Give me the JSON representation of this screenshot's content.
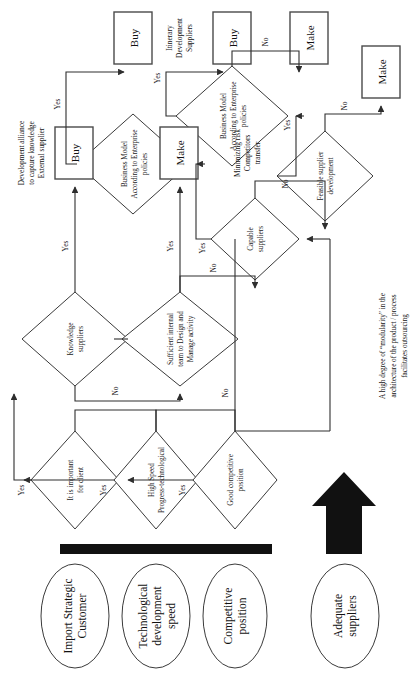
{
  "figure": {
    "type": "flowchart",
    "orientation": "rotated-90-ccw"
  },
  "inputs": [
    {
      "id": "oval1",
      "label_line1": "Import Strategic",
      "label_line2": "Customer"
    },
    {
      "id": "oval2",
      "label_line1": "Technological",
      "label_line2": "development",
      "label_line3": "speed"
    },
    {
      "id": "oval3",
      "label_line1": "Competitive",
      "label_line2": "position"
    },
    {
      "id": "oval4",
      "label_line1": "Adequate",
      "label_line2": "suppliers"
    }
  ],
  "decisions": [
    {
      "id": "d1",
      "line1": "It is important",
      "line2": "for client"
    },
    {
      "id": "d2",
      "line1": "High Speed",
      "line2": "Progress-technological"
    },
    {
      "id": "d3",
      "line1": "Good competitive",
      "line2": "position"
    },
    {
      "id": "d4",
      "line1": "Knowledge",
      "line2": "suppliers"
    },
    {
      "id": "d5",
      "line1": "Sufficient internal",
      "line2": "team to Design and",
      "line3": "Manage activity"
    },
    {
      "id": "d6",
      "line1": "Capable",
      "line2": "suppliers"
    },
    {
      "id": "d7",
      "line1": "Feasible supplier",
      "line2": "development"
    },
    {
      "id": "d8",
      "line1": "Business Model",
      "line2": "According to Enterprise",
      "line3": "policies"
    },
    {
      "id": "d9",
      "line1": "Business Model",
      "line2": "According to Enterprise",
      "line3": "policies"
    }
  ],
  "terminals": [
    {
      "id": "buy1",
      "label": "Buy"
    },
    {
      "id": "make1",
      "label": "Make"
    },
    {
      "id": "buy2",
      "label": "Buy"
    },
    {
      "id": "buy3",
      "label": "Buy"
    },
    {
      "id": "make2",
      "label": "Make"
    },
    {
      "id": "make3",
      "label": "Make"
    }
  ],
  "edge_labels": {
    "yes": "Yes",
    "no": "No"
  },
  "edges": [
    {
      "from": "d1",
      "to": "d4",
      "label": "Yes"
    },
    {
      "from": "d1",
      "to": "d2",
      "label": ""
    },
    {
      "from": "d2",
      "to": "d4",
      "label": "Yes"
    },
    {
      "from": "d2",
      "to": "d3",
      "label": ""
    },
    {
      "from": "d3",
      "to": "d5",
      "label": "Yes"
    },
    {
      "from": "d3",
      "to": "d6",
      "label": "No"
    },
    {
      "from": "d4",
      "to": "buy1",
      "label": "Yes"
    },
    {
      "from": "d4",
      "to": "d5",
      "label": "No"
    },
    {
      "from": "d5",
      "to": "make1",
      "label": "Yes"
    },
    {
      "from": "d5",
      "to": "d6",
      "label": "No"
    },
    {
      "from": "d6",
      "to": "d8",
      "label": "Yes"
    },
    {
      "from": "d6",
      "to": "d7",
      "label": "No"
    },
    {
      "from": "d7",
      "to": "d9",
      "label": "Yes"
    },
    {
      "from": "d7",
      "to": "make3",
      "label": "No"
    },
    {
      "from": "d8",
      "to": "buy2",
      "label": "Yes"
    },
    {
      "from": "d9",
      "to": "buy3",
      "label": "Yes"
    },
    {
      "from": "d9",
      "to": "make2",
      "label": "No"
    }
  ],
  "annotations": [
    {
      "id": "note-buy1",
      "line1": "Development alliance",
      "line2": "to capture knowledge",
      "line3": "External supplier"
    },
    {
      "id": "note-make1",
      "line1": "Minimizing risk",
      "line2": "Competitors",
      "line3": "transfer"
    },
    {
      "id": "note-buy3",
      "line1": "Itinerary",
      "line2": "Development",
      "line3": "Suppliers"
    }
  ],
  "footnote": {
    "line1": "A high degree of “modularity” in the",
    "line2": "architecture of the product / process",
    "line3": "facilitates outsourcing"
  },
  "colors": {
    "background": "#ffffff",
    "stroke": "#3a3a3a",
    "text": "#111111",
    "arrow_block": "#111111"
  }
}
